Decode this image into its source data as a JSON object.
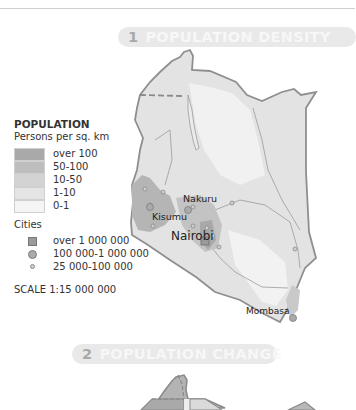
{
  "sections": [
    {
      "number": "1",
      "title": "POPULATION DENSITY"
    },
    {
      "number": "2",
      "title": "POPULATION CHANGE"
    }
  ],
  "legend": {
    "title": "POPULATION",
    "subtitle": "Persons per sq. km",
    "classes": [
      {
        "label": "over 100",
        "color": "#a9a9a9"
      },
      {
        "label": "50-100",
        "color": "#bdbdbd"
      },
      {
        "label": "10-50",
        "color": "#d3d3d3"
      },
      {
        "label": "1-10",
        "color": "#e4e4e4"
      },
      {
        "label": "0-1",
        "color": "#f5f5f5"
      }
    ],
    "cities_title": "Cities",
    "cities": [
      {
        "symbol": "square",
        "label": "over 1 000 000"
      },
      {
        "symbol": "circle-large",
        "label": "100 000-1 000 000"
      },
      {
        "symbol": "circle-small",
        "label": "25 000-100 000"
      }
    ],
    "scale": "SCALE 1:15 000 000"
  },
  "map": {
    "cities": [
      {
        "name": "Nakuru",
        "x": 187,
        "y": 210
      },
      {
        "name": "Kisumu",
        "x": 151,
        "y": 218
      },
      {
        "name": "Nairobi",
        "x": 206,
        "y": 240
      },
      {
        "name": "Mombasa",
        "x": 296,
        "y": 317
      }
    ]
  }
}
